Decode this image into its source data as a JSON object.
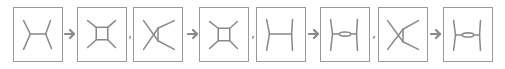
{
  "colors": {
    "stroke": "#8a8a8a",
    "border": "#9a9a9a",
    "arrow": "#8a8a8a"
  },
  "diagrams": [
    {
      "id": 1,
      "type": "tree-channel-H"
    },
    {
      "id": 2,
      "type": "box-loop"
    },
    {
      "id": 3,
      "type": "crossed-triangle"
    },
    {
      "id": 4,
      "type": "box-loop"
    },
    {
      "id": 5,
      "type": "tree-channel-H-vertical"
    },
    {
      "id": 6,
      "type": "bubble-H"
    },
    {
      "id": 7,
      "type": "crossed-triangle"
    },
    {
      "id": 8,
      "type": "bubble-H"
    }
  ],
  "separators": [
    {
      "after": 1,
      "kind": "arrow"
    },
    {
      "after": 2,
      "kind": "comma",
      "text": ","
    },
    {
      "after": 3,
      "kind": "arrow"
    },
    {
      "after": 4,
      "kind": "comma",
      "text": ","
    },
    {
      "after": 5,
      "kind": "arrow"
    },
    {
      "after": 6,
      "kind": "comma",
      "text": ","
    },
    {
      "after": 7,
      "kind": "arrow"
    }
  ]
}
